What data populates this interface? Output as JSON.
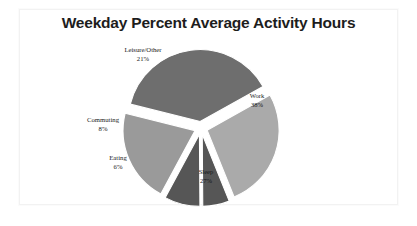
{
  "chart_data": {
    "type": "pie",
    "title": "Weekday Percent Average Activity Hours",
    "xlabel": "",
    "ylabel": "",
    "legend": "none",
    "grid": false,
    "exploded": true,
    "value_unit": "percent",
    "categories": [
      "Work",
      "Sleep",
      "Eating",
      "Commuting",
      "Leisure/Other"
    ],
    "values": [
      38,
      27,
      6,
      8,
      21
    ],
    "slices": [
      {
        "label": "Work",
        "value": 38,
        "value_text": "38%",
        "color": "#6e6e6e",
        "label_position": "inside",
        "label_x": 257,
        "label_y": 96,
        "value_x": 257,
        "value_y": 105
      },
      {
        "label": "Sleep",
        "value": 27,
        "value_text": "27%",
        "color": "#aaaaaa",
        "label_position": "inside",
        "label_x": 206,
        "label_y": 172,
        "value_x": 206,
        "value_y": 181
      },
      {
        "label": "Eating",
        "value": 6,
        "value_text": "6%",
        "color": "#565656",
        "label_position": "outside",
        "label_x": 118,
        "label_y": 158,
        "value_x": 118,
        "value_y": 167
      },
      {
        "label": "Commuting",
        "value": 8,
        "value_text": "8%",
        "color": "#565656",
        "label_position": "outside",
        "label_x": 103,
        "label_y": 120,
        "value_x": 103,
        "value_y": 129
      },
      {
        "label": "Leisure/Other",
        "value": 21,
        "value_text": "21%",
        "color": "#9a9a9a",
        "label_position": "outside",
        "label_x": 143,
        "label_y": 50,
        "value_x": 143,
        "value_y": 59
      }
    ],
    "colors": {
      "work": "#6e6e6e",
      "sleep": "#aaaaaa",
      "eating": "#565656",
      "commuting": "#565656",
      "leisure_other": "#9a9a9a",
      "background": "#ffffff",
      "title": "#1d1d1d",
      "card_border": "#f2f2f2"
    }
  }
}
